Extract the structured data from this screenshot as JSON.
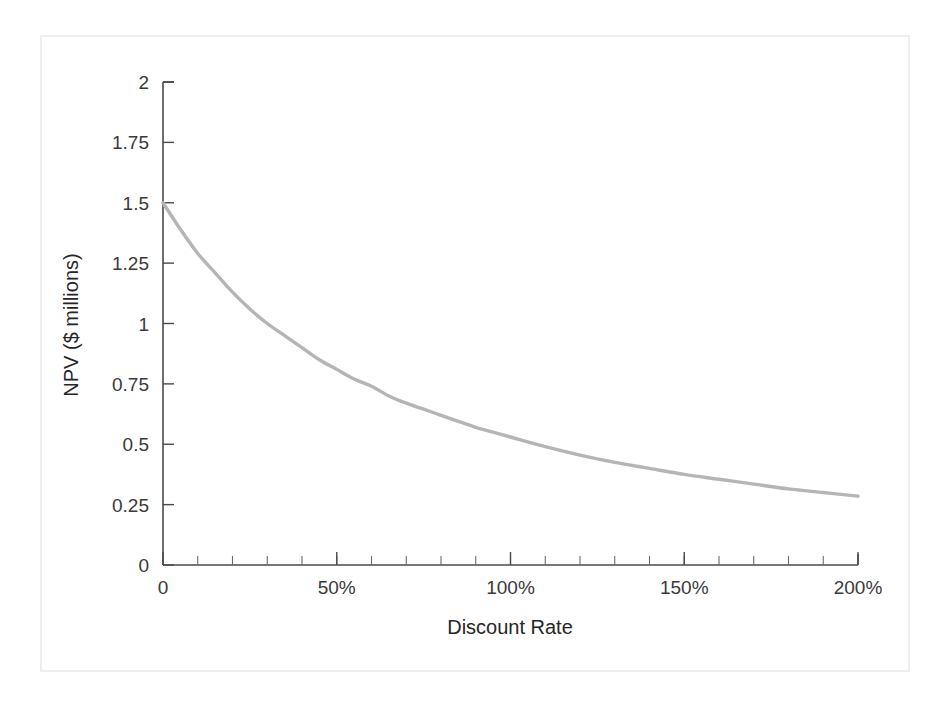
{
  "figure": {
    "background_color": "#ffffff",
    "frame_color": "#eceff0",
    "axis_color": "#4a4a4a",
    "curve_color": "#b5b5b5"
  },
  "chart_data": {
    "type": "line",
    "title": "",
    "subtitle": "",
    "xlabel": "Discount Rate",
    "ylabel": "NPV ($ millions)",
    "xlim": [
      0,
      200
    ],
    "ylim": [
      0,
      2
    ],
    "grid": false,
    "legend": null,
    "legend_position": "none",
    "x_tick_labels": [
      "0",
      "50%",
      "100%",
      "150%",
      "200%"
    ],
    "x_tick_values": [
      0,
      50,
      100,
      150,
      200
    ],
    "x_minor_tick_interval": 10,
    "y_tick_labels": [
      "0",
      "0.25",
      "0.5",
      "0.75",
      "1",
      "1.25",
      "1.5",
      "1.75",
      "2"
    ],
    "y_tick_values": [
      0,
      0.25,
      0.5,
      0.75,
      1,
      1.25,
      1.5,
      1.75,
      2
    ],
    "series": [
      {
        "name": "NPV profile",
        "color": "#b5b5b5",
        "x": [
          0,
          5,
          10,
          15,
          20,
          25,
          30,
          35,
          40,
          45,
          50,
          55,
          60,
          65,
          70,
          75,
          80,
          85,
          90,
          95,
          100,
          110,
          120,
          130,
          140,
          150,
          160,
          170,
          180,
          190,
          200
        ],
        "y": [
          1.5,
          1.39,
          1.29,
          1.21,
          1.13,
          1.06,
          1.0,
          0.95,
          0.9,
          0.85,
          0.81,
          0.77,
          0.74,
          0.7,
          0.67,
          0.645,
          0.62,
          0.595,
          0.57,
          0.55,
          0.53,
          0.49,
          0.455,
          0.425,
          0.4,
          0.375,
          0.355,
          0.335,
          0.315,
          0.3,
          0.285
        ]
      }
    ],
    "annotations": []
  }
}
